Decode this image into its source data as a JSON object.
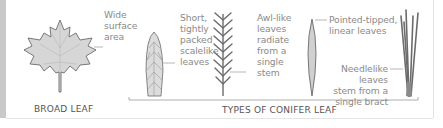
{
  "diagram": {
    "broad_leaf": {
      "caption": "BROAD LEAF",
      "annotation": [
        "Wide",
        "surface",
        "area"
      ]
    },
    "conifer_group": {
      "caption": "TYPES OF CONIFER LEAF",
      "leaves": [
        {
          "type": "scalelike",
          "annotation": [
            "Short,",
            "tightly",
            "packed",
            "scalelike",
            "leaves"
          ]
        },
        {
          "type": "awl-like",
          "annotation": [
            "Awl-like",
            "leaves",
            "radiate",
            "from a",
            "single",
            "stem"
          ]
        },
        {
          "type": "linear",
          "annotation": [
            "Pointed-tipped,",
            "linear leaves"
          ]
        },
        {
          "type": "needlelike",
          "annotation": [
            "Needlelike leaves",
            "stem from a",
            "single bract"
          ]
        }
      ]
    },
    "colors": {
      "leaf_fill": "#d6d6d6",
      "leaf_stroke": "#6b6b6b",
      "text": "#8a8a8a",
      "caption": "#555555",
      "bracket": "#9a9a9a"
    }
  }
}
